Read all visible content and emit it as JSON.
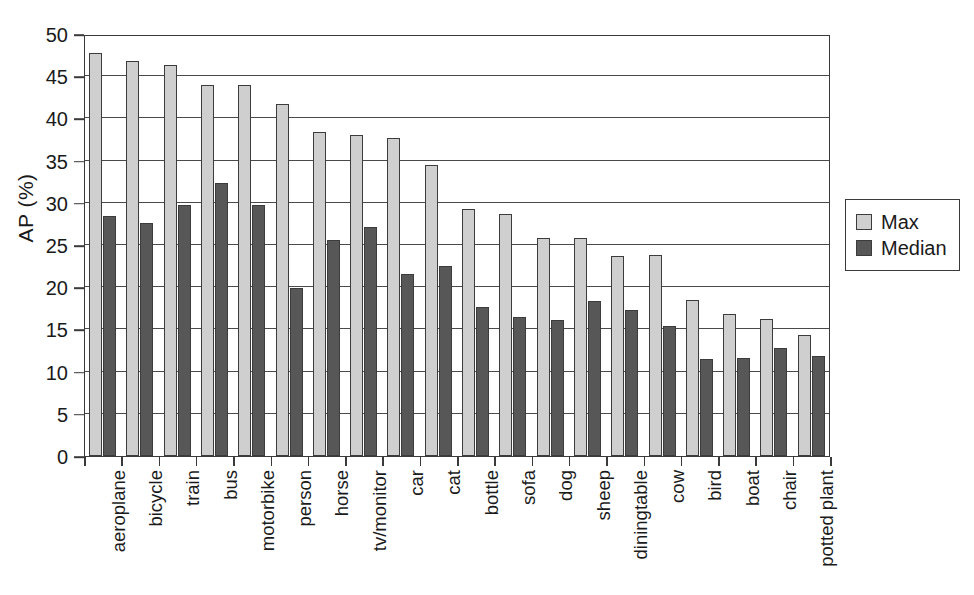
{
  "chart_data": {
    "type": "bar",
    "title": "",
    "xlabel": "",
    "ylabel": "AP (%)",
    "ylim": [
      0,
      50
    ],
    "ytick_step": 5,
    "yticks": [
      0,
      5,
      10,
      15,
      20,
      25,
      30,
      35,
      40,
      45,
      50
    ],
    "grid": true,
    "legend_position": "right",
    "categories": [
      "aeroplane",
      "bicycle",
      "train",
      "bus",
      "motorbike",
      "person",
      "horse",
      "tv/monitor",
      "car",
      "cat",
      "bottle",
      "sofa",
      "dog",
      "sheep",
      "diningtable",
      "cow",
      "bird",
      "boat",
      "chair",
      "potted plant"
    ],
    "series": [
      {
        "name": "Max",
        "color": "#cfcfcf",
        "values": [
          47.7,
          46.8,
          46.3,
          43.9,
          44.0,
          41.7,
          38.4,
          38.0,
          37.7,
          34.5,
          29.3,
          28.7,
          25.8,
          25.8,
          23.7,
          23.8,
          18.5,
          16.8,
          16.2,
          14.3
        ]
      },
      {
        "name": "Median",
        "color": "#575757",
        "values": [
          28.4,
          27.6,
          29.8,
          32.3,
          29.7,
          19.9,
          25.6,
          27.1,
          21.6,
          22.5,
          17.7,
          16.5,
          16.1,
          18.4,
          17.3,
          15.4,
          11.5,
          11.6,
          12.8,
          11.9
        ]
      }
    ]
  },
  "legend": {
    "items": [
      {
        "label": "Max",
        "swatch": "max"
      },
      {
        "label": "Median",
        "swatch": "median"
      }
    ]
  }
}
